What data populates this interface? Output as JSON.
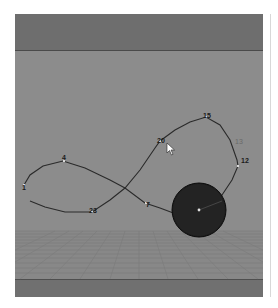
{
  "viewport": {
    "colors": {
      "top_band": "#6e6e6e",
      "wall": "#8c8c8c",
      "floor": "#888888",
      "bottom_band": "#707070",
      "curve": "#2a2a2a",
      "sphere": "#1c1c1c"
    }
  },
  "path_labels": {
    "start": "1",
    "four": "4",
    "seven": "7",
    "twelve": "12",
    "thirteen": "13",
    "fifteen": "15",
    "twenty": "20",
    "twentythree": "23"
  },
  "cursor": {
    "icon": "arrow-cursor-icon"
  }
}
